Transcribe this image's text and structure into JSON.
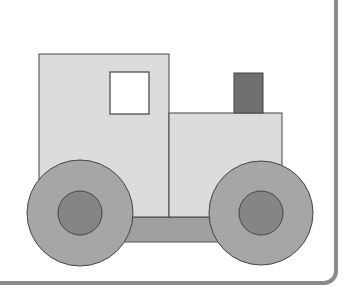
{
  "illustration": {
    "subject": "toy tractor",
    "colors": {
      "background": "#ffffff",
      "panel_border": "#8a8a8a",
      "cab_fill": "#dcdcdc",
      "body_fill": "#dcdcdc",
      "window_fill": "#ffffff",
      "chimney_fill": "#707070",
      "chassis_fill": "#a0a0a0",
      "wheel_fill": "#a6a6a6",
      "hub_fill": "#858585",
      "outline": "#444444"
    },
    "parts": [
      {
        "name": "cab",
        "shape": "rect"
      },
      {
        "name": "window",
        "shape": "rect"
      },
      {
        "name": "hood",
        "shape": "rect"
      },
      {
        "name": "chimney",
        "shape": "rect"
      },
      {
        "name": "chassis",
        "shape": "rect"
      },
      {
        "name": "left-wheel",
        "shape": "circle"
      },
      {
        "name": "right-wheel",
        "shape": "circle"
      }
    ]
  }
}
